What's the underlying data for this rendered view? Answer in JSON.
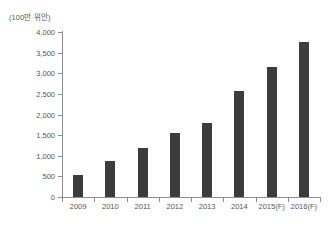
{
  "unit_label": "(100만 위안)",
  "colors": {
    "bar": "#3c3c3c",
    "axis": "#8d8d8d",
    "text": "#555555",
    "background": "#ffffff"
  },
  "chart_data": {
    "type": "bar",
    "title": "",
    "subtitle": "",
    "xlabel": "",
    "ylabel": "(100만 위안)",
    "categories": [
      "2009",
      "2010",
      "2011",
      "2012",
      "2013",
      "2014",
      "2015(F)",
      "2016(F)"
    ],
    "values": [
      530,
      870,
      1190,
      1550,
      1790,
      2570,
      3160,
      3750
    ],
    "ylim": [
      0,
      4000
    ],
    "ytick_values": [
      0,
      500,
      1000,
      1500,
      2000,
      2500,
      3000,
      3500,
      4000
    ],
    "ytick_labels": [
      "0",
      "500",
      "1,000",
      "1,500",
      "2,000",
      "2,500",
      "3,000",
      "3,500",
      "4,000"
    ],
    "grid": false,
    "legend": false,
    "legend_position": "none",
    "series": [
      {
        "name": "",
        "values": [
          530,
          870,
          1190,
          1550,
          1790,
          2570,
          3160,
          3750
        ]
      }
    ],
    "annotations": []
  }
}
